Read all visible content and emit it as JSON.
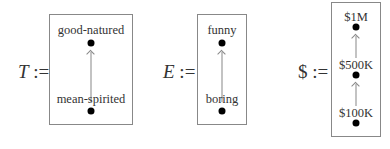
{
  "orders": [
    {
      "symbol": "T",
      "assign": ":=",
      "elements": [
        {
          "label": "good-natured",
          "rank": "top"
        },
        {
          "label": "mean-spirited",
          "rank": "bottom"
        }
      ]
    },
    {
      "symbol": "E",
      "assign": ":=",
      "elements": [
        {
          "label": "funny",
          "rank": "top"
        },
        {
          "label": "boring",
          "rank": "bottom"
        }
      ]
    },
    {
      "symbol": "$",
      "assign": ":=",
      "elements": [
        {
          "label": "$1M",
          "rank": "top"
        },
        {
          "label": "$500K",
          "rank": "middle"
        },
        {
          "label": "$100K",
          "rank": "bottom"
        }
      ]
    }
  ],
  "colors": {
    "box_border": "#888888",
    "arrow": "#888888",
    "dot": "#000000"
  }
}
